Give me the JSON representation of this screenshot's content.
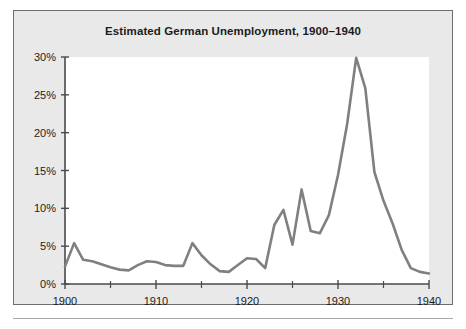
{
  "figure": {
    "title": "Estimated German Unemployment, 1900–1940",
    "background_color": "#e9e9e9",
    "plot_background_color": "#ffffff",
    "border_color": "#6d6d6d",
    "line_color": "#808080",
    "axis_color": "#4a4a4a"
  },
  "chart_data": {
    "type": "line",
    "title": "Estimated German Unemployment, 1900–1940",
    "xlabel": "",
    "ylabel": "",
    "xlim": [
      1900,
      1940
    ],
    "ylim": [
      0,
      30
    ],
    "grid": false,
    "legend": null,
    "x_tick_labels": [
      "1900",
      "1910",
      "1920",
      "1930",
      "1940"
    ],
    "x_major_ticks": [
      1900,
      1910,
      1920,
      1930,
      1940
    ],
    "x_minor_ticks": [
      1905,
      1915,
      1925,
      1935
    ],
    "y_tick_labels": [
      "0%",
      "5%",
      "10%",
      "15%",
      "20%",
      "25%",
      "30%"
    ],
    "y_ticks": [
      0,
      5,
      10,
      15,
      20,
      25,
      30
    ],
    "y_unit": "%",
    "series": [
      {
        "name": "Estimated German unemployment rate",
        "x": [
          1900,
          1901,
          1902,
          1903,
          1904,
          1905,
          1906,
          1907,
          1908,
          1909,
          1910,
          1911,
          1912,
          1913,
          1914,
          1915,
          1916,
          1917,
          1918,
          1919,
          1920,
          1921,
          1922,
          1923,
          1924,
          1925,
          1926,
          1927,
          1928,
          1929,
          1930,
          1931,
          1932,
          1933,
          1934,
          1935,
          1936,
          1937,
          1938,
          1939,
          1940
        ],
        "values": [
          2.3,
          5.4,
          3.2,
          3.0,
          2.6,
          2.2,
          1.9,
          1.8,
          2.5,
          3.0,
          2.9,
          2.5,
          2.4,
          2.4,
          5.4,
          3.8,
          2.6,
          1.7,
          1.6,
          2.5,
          3.4,
          3.3,
          2.1,
          7.8,
          9.8,
          5.2,
          12.5,
          7.0,
          6.7,
          9.1,
          14.4,
          21.1,
          29.9,
          25.9,
          14.8,
          11.0,
          8.0,
          4.5,
          2.1,
          1.6,
          1.4
        ]
      }
    ]
  }
}
